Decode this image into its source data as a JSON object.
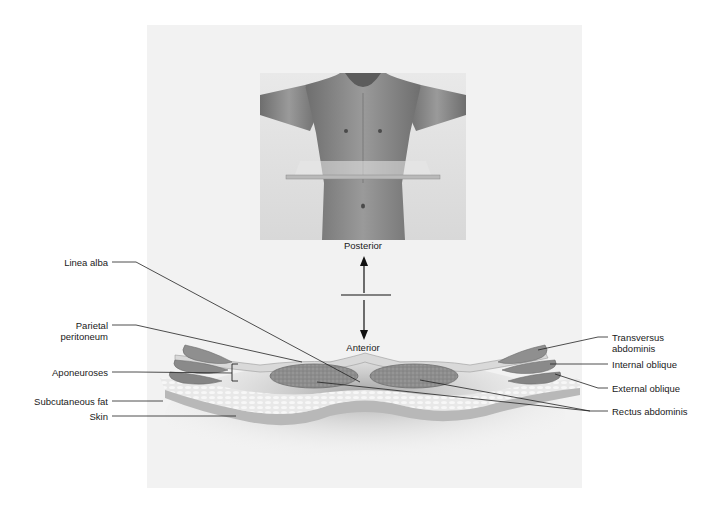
{
  "figure": {
    "orientation": {
      "top_label": "Posterior",
      "bottom_label": "Anterior"
    },
    "left_labels": [
      {
        "text": "Linea alba"
      },
      {
        "text": "Parietal\nperitoneum",
        "line1": "Parietal",
        "line2": "peritoneum"
      },
      {
        "text": "Aponeuroses"
      },
      {
        "text": "Subcutaneous fat"
      },
      {
        "text": "Skin"
      }
    ],
    "right_labels": [
      {
        "text": "Transversus\nabdominis",
        "line1": "Transversus",
        "line2": "abdominis"
      },
      {
        "text": "Internal oblique"
      },
      {
        "text": "External oblique"
      },
      {
        "text": "Rectus abdominis"
      }
    ],
    "colors": {
      "background": "#ffffff",
      "panel": "#f2f2f2",
      "muscle": "#8a8a8a",
      "fat": "#e6e6e6",
      "skin": "#bdbdbd",
      "line": "#222222"
    }
  }
}
